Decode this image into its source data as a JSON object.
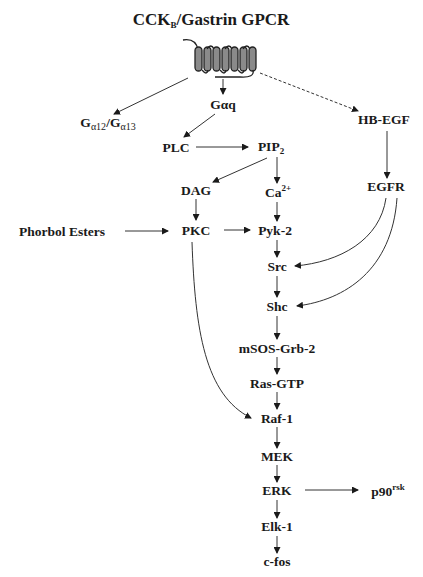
{
  "title": {
    "main": "CCK",
    "sub": "B",
    "rest": "/Gastrin GPCR"
  },
  "nodes": {
    "gq": "Gαq",
    "g12_a": "G",
    "g12_sub_a": "α12",
    "g12_mid": "/G",
    "g12_sub_b": "α13",
    "hbegf": "HB-EGF",
    "plc": "PLC",
    "pip": "PIP",
    "pip_sub": "2",
    "dag": "DAG",
    "ca": "Ca",
    "ca_sup": "2+",
    "egfr": "EGFR",
    "phorbol": "Phorbol Esters",
    "pkc": "PKC",
    "pyk2": "Pyk-2",
    "src": "Src",
    "shc": "Shc",
    "msos": "mSOS-Grb-2",
    "ras": "Ras-GTP",
    "raf": "Raf-1",
    "mek": "MEK",
    "erk": "ERK",
    "p90": "p90",
    "p90_sup": "rsk",
    "elk": "Elk-1",
    "cfos": "c-fos"
  },
  "colors": {
    "ink": "#1a1a1a",
    "line": "#333333",
    "receptor_fill": "#8a8a8a"
  }
}
